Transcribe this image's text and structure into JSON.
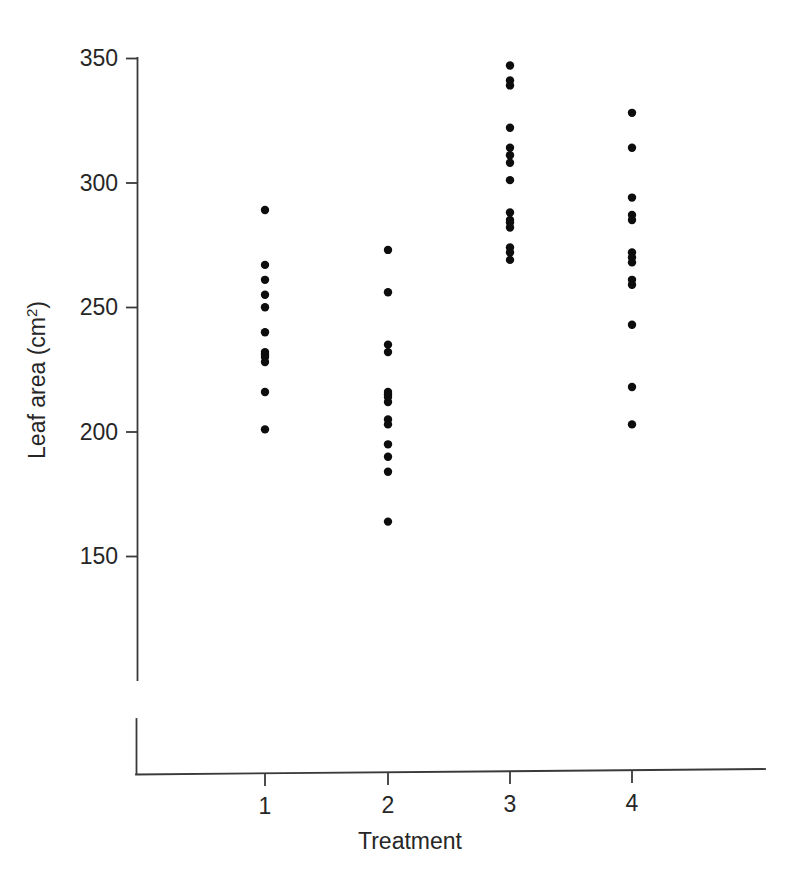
{
  "chart_data": {
    "type": "scatter",
    "title": "",
    "subtitle": "",
    "xlabel": "Treatment",
    "ylabel": "Leaf area (cm²)",
    "ylabel_base": "Leaf area (cm",
    "ylabel_sup": "2",
    "ylabel_close": ")",
    "x_categories": [
      "1",
      "2",
      "3",
      "4"
    ],
    "x_tick_labels": [
      "1",
      "2",
      "3",
      "4"
    ],
    "y_tick_labels": [
      "350",
      "300",
      "250",
      "200",
      "150"
    ],
    "y_tick_values": [
      350,
      300,
      250,
      200,
      150
    ],
    "ylim": [
      120,
      352
    ],
    "xlim": [
      0.4,
      4.8
    ],
    "grid": false,
    "legend": null,
    "marker": "filled-circle",
    "marker_color": "#0d0d0d",
    "marker_radius_px": 4.2,
    "series": [
      {
        "name": "Treatment 1",
        "x": 1,
        "values": [
          289,
          267,
          261,
          255,
          250,
          240,
          232,
          231,
          230,
          228,
          216,
          201
        ]
      },
      {
        "name": "Treatment 2",
        "x": 2,
        "values": [
          273,
          256,
          235,
          232,
          216,
          215,
          214,
          212,
          205,
          203,
          195,
          190,
          184,
          164
        ]
      },
      {
        "name": "Treatment 3",
        "x": 3,
        "values": [
          347,
          341,
          339,
          322,
          314,
          311,
          308,
          301,
          288,
          285,
          284,
          282,
          274,
          272,
          269
        ]
      },
      {
        "name": "Treatment 4",
        "x": 4,
        "values": [
          328,
          314,
          294,
          287,
          285,
          272,
          270,
          268,
          261,
          259,
          243,
          218,
          203
        ]
      }
    ]
  },
  "axes": {
    "y_axis_name": "leaf-area-axis",
    "x_axis_name": "treatment-axis"
  }
}
